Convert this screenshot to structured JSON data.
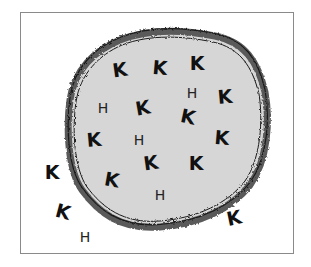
{
  "diagram": {
    "type": "cell-ion-distribution",
    "colors": {
      "frame": "#8a8a8a",
      "cytoplasm": "#d6d6d6",
      "membrane": "#555555",
      "membrane_edge": "#1a1a1a",
      "letters": "#111111"
    },
    "inside": [
      {
        "label": "K",
        "x": 120,
        "y": 70,
        "rot": -8
      },
      {
        "label": "K",
        "x": 160,
        "y": 68,
        "rot": 5
      },
      {
        "label": "K",
        "x": 197,
        "y": 63,
        "rot": 0
      },
      {
        "label": "H",
        "x": 192,
        "y": 93,
        "rot": 0
      },
      {
        "label": "K",
        "x": 225,
        "y": 97,
        "rot": -5
      },
      {
        "label": "H",
        "x": 103,
        "y": 108,
        "rot": 0
      },
      {
        "label": "K",
        "x": 143,
        "y": 108,
        "rot": -10
      },
      {
        "label": "K",
        "x": 188,
        "y": 117,
        "rot": 12
      },
      {
        "label": "K",
        "x": 94,
        "y": 140,
        "rot": -5
      },
      {
        "label": "H",
        "x": 139,
        "y": 140,
        "rot": 0
      },
      {
        "label": "K",
        "x": 222,
        "y": 138,
        "rot": 5
      },
      {
        "label": "K",
        "x": 151,
        "y": 163,
        "rot": -8
      },
      {
        "label": "K",
        "x": 196,
        "y": 163,
        "rot": 0
      },
      {
        "label": "K",
        "x": 112,
        "y": 180,
        "rot": 10
      },
      {
        "label": "H",
        "x": 160,
        "y": 195,
        "rot": 0
      }
    ],
    "outside": [
      {
        "label": "K",
        "x": 52,
        "y": 172,
        "rot": 0
      },
      {
        "label": "K",
        "x": 63,
        "y": 212,
        "rot": 15
      },
      {
        "label": "K",
        "x": 234,
        "y": 218,
        "rot": -12
      },
      {
        "label": "H",
        "x": 85,
        "y": 237,
        "rot": 0
      }
    ]
  }
}
